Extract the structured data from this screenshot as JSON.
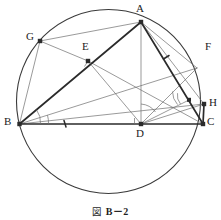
{
  "figure": {
    "caption_symbol": "図",
    "caption_text": "B－2",
    "caption_full": "図 B－2",
    "type": "euclidean-geometry-diagram"
  },
  "colors": {
    "stroke_dark": "#2b2b2b",
    "stroke_light": "#6e6e6e",
    "stroke_circle": "#3a3a3a",
    "label_color": "#1c1c1c",
    "background": "#ffffff"
  },
  "circle": {
    "label": "circumcircle",
    "cx": 108.5,
    "cy": 101.5,
    "r": 92
  },
  "points": [
    {
      "id": "A",
      "label": "A",
      "x": 141,
      "y": 22,
      "label_x": 137,
      "label_y": 4,
      "marked": true
    },
    {
      "id": "B",
      "label": "B",
      "x": 19.5,
      "y": 124,
      "label_x": 5,
      "label_y": 118,
      "marked": true
    },
    {
      "id": "C",
      "label": "C",
      "x": 203,
      "y": 124,
      "label_x": 207,
      "label_y": 118,
      "marked": true
    },
    {
      "id": "D",
      "label": "D",
      "x": 141,
      "y": 124,
      "label_x": 137,
      "label_y": 129,
      "marked": true
    },
    {
      "id": "E",
      "label": "E",
      "x": 88,
      "y": 61,
      "label_x": 83,
      "label_y": 43,
      "marked": true
    },
    {
      "id": "G",
      "label": "G",
      "x": 40,
      "y": 41,
      "label_x": 27,
      "label_y": 33,
      "marked": true
    },
    {
      "id": "F",
      "label": "F",
      "x": 197,
      "y": 68,
      "label_x": 205,
      "label_y": 43,
      "marked": false
    },
    {
      "id": "H",
      "label": "H",
      "x": 204,
      "y": 104,
      "label_x": 208,
      "label_y": 99,
      "marked": true
    },
    {
      "id": "P",
      "label": "",
      "x": 189,
      "y": 100,
      "label_x": 0,
      "label_y": 0,
      "marked": true
    }
  ],
  "segments": [
    {
      "name": "segment-BA",
      "from": "B",
      "to": "A",
      "weight": "heavy"
    },
    {
      "name": "segment-BC",
      "from": "B",
      "to": "C",
      "weight": "heavy"
    },
    {
      "name": "segment-AC",
      "from": "A",
      "to": "C",
      "weight": "heavy"
    },
    {
      "name": "segment-AD",
      "from": "A",
      "to": "D",
      "weight": "light"
    },
    {
      "name": "segment-AG",
      "from": "A",
      "to": "G",
      "weight": "light"
    },
    {
      "name": "segment-GB",
      "from": "G",
      "to": "B",
      "weight": "light"
    },
    {
      "name": "segment-GE",
      "from": "G",
      "to": "E",
      "weight": "light"
    },
    {
      "name": "segment-EC",
      "from": "E",
      "to": "C",
      "weight": "light"
    },
    {
      "name": "segment-ED",
      "from": "E",
      "to": "D",
      "weight": "light"
    },
    {
      "name": "segment-BF",
      "from": "B",
      "to": "F",
      "weight": "light"
    },
    {
      "name": "segment-BH",
      "from": "B",
      "to": "H",
      "weight": "light"
    },
    {
      "name": "segment-AF",
      "from": "A",
      "to": "F",
      "weight": "light"
    },
    {
      "name": "segment-AH",
      "from": "A",
      "to": "H",
      "weight": "light"
    },
    {
      "name": "segment-DH",
      "from": "D",
      "to": "H",
      "weight": "light"
    },
    {
      "name": "segment-CH",
      "from": "C",
      "to": "H",
      "weight": "heavy"
    },
    {
      "name": "segment-DF",
      "from": "D",
      "to": "F",
      "weight": "light"
    }
  ],
  "tick_marks": [
    {
      "name": "tick-on-BD",
      "x": 65,
      "y": 124,
      "angle": 78
    },
    {
      "name": "tick-on-AC",
      "x": 166,
      "y": 57,
      "angle": 30
    }
  ],
  "right_angles": [
    {
      "name": "right-angle-at-D",
      "vertex": "D"
    },
    {
      "name": "right-angle-at-E",
      "vertex": "E"
    }
  ],
  "angle_arcs": [
    {
      "name": "angle-arc-at-B-upper"
    },
    {
      "name": "angle-arc-at-B-lower"
    },
    {
      "name": "angle-arc-at-D"
    },
    {
      "name": "angle-arc-at-P-upper"
    },
    {
      "name": "angle-arc-at-P-lower"
    }
  ]
}
